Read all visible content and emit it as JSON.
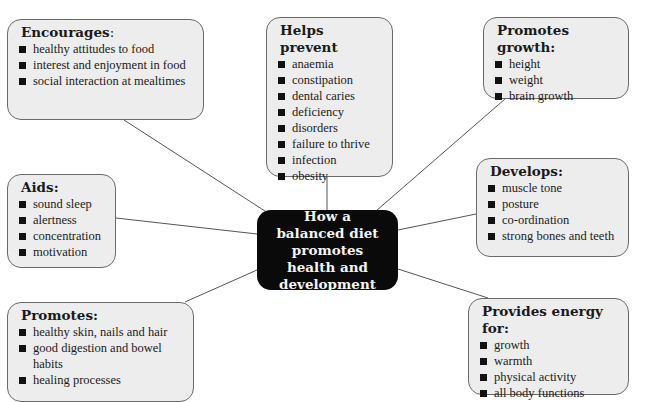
{
  "center": {
    "label": "How a balanced diet promotes health and development",
    "color": "#0a0a0a",
    "text_color": "#f4f4f4"
  },
  "box_color": "#ededed",
  "nodes": [
    {
      "title": "Encourages",
      "title_suffix": ":",
      "items": [
        "healthy attitudes to food",
        "interest and enjoyment in food",
        "social interaction at mealtimes"
      ]
    },
    {
      "title": "Helps prevent",
      "title_suffix": "",
      "items": [
        "anaemia",
        "constipation",
        "dental caries",
        "deficiency",
        "disorders",
        "failure to thrive",
        "infection",
        "obesity"
      ]
    },
    {
      "title": "Promotes growth:",
      "title_suffix": "",
      "items": [
        "height",
        "weight",
        "brain growth"
      ]
    },
    {
      "title": "Aids:",
      "title_suffix": "",
      "items": [
        "sound sleep",
        "alertness",
        "concentration",
        "motivation"
      ]
    },
    {
      "title": "Develops:",
      "title_suffix": "",
      "items": [
        "muscle tone",
        "posture",
        "co-ordination",
        "strong bones and teeth"
      ]
    },
    {
      "title": "Promotes:",
      "title_suffix": "",
      "items": [
        "healthy skin, nails and hair",
        "good digestion and bowel habits",
        "healing processes"
      ]
    },
    {
      "title": "Provides energy for:",
      "title_suffix": "",
      "items": [
        "growth",
        "warmth",
        "physical activity",
        "all body functions"
      ]
    }
  ]
}
